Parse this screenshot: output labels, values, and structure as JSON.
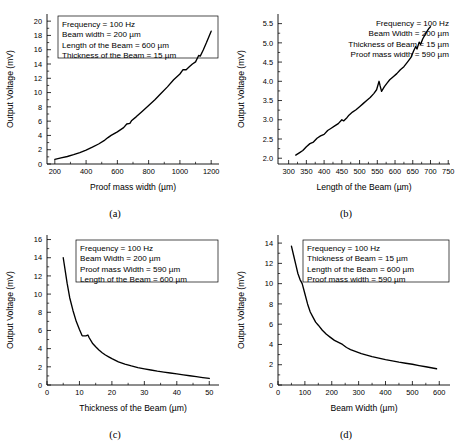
{
  "figure": {
    "title": "",
    "panel_labels": [
      "(a)",
      "(b)",
      "(c)",
      "(d)"
    ]
  },
  "chart_data": [
    {
      "id": "a",
      "type": "line",
      "title": "",
      "panel_label": "(a)",
      "xlabel": "Proof mass width (µm)",
      "ylabel": "Output Voltage (mV)",
      "xlim": [
        150,
        1250
      ],
      "ylim": [
        0,
        21
      ],
      "xticks": [
        200,
        400,
        600,
        800,
        1000,
        1200
      ],
      "yticks": [
        0,
        2,
        4,
        6,
        8,
        10,
        12,
        14,
        16,
        18,
        20
      ],
      "grid": false,
      "legend": null,
      "annotations": [
        "Frequency = 100 Hz",
        "Beam width = 200 µm",
        "Length of the Beam = 600 µm",
        "Thickness of the Beam = 15 µm"
      ],
      "annotation_boxed": true,
      "x": [
        200,
        240,
        280,
        320,
        360,
        400,
        440,
        480,
        520,
        540,
        560,
        600,
        640,
        660,
        680,
        690,
        720,
        760,
        800,
        840,
        880,
        920,
        960,
        1000,
        1020,
        1040,
        1060,
        1080,
        1100,
        1120,
        1130,
        1150,
        1170,
        1200
      ],
      "y": [
        0.65,
        0.85,
        1.05,
        1.3,
        1.6,
        1.95,
        2.35,
        2.8,
        3.35,
        3.7,
        4.0,
        4.5,
        5.1,
        5.6,
        5.7,
        6.05,
        6.6,
        7.4,
        8.2,
        9.0,
        9.9,
        10.8,
        11.8,
        12.6,
        13.2,
        13.2,
        13.6,
        14.0,
        14.3,
        15.2,
        15.1,
        16.0,
        17.0,
        18.6
      ]
    },
    {
      "id": "b",
      "type": "line",
      "title": "",
      "panel_label": "(b)",
      "xlabel": "Length of the Beam (µm)",
      "ylabel": "Output Voltage (mV)",
      "xlim": [
        270,
        755
      ],
      "ylim": [
        1.85,
        5.75
      ],
      "xticks": [
        300,
        350,
        400,
        450,
        500,
        550,
        600,
        650,
        700,
        750
      ],
      "yticks": [
        2.0,
        2.5,
        3.0,
        3.5,
        4.0,
        4.5,
        5.0,
        5.5
      ],
      "grid": false,
      "legend": null,
      "annotations": [
        "Frequency = 100 Hz",
        "Beam Width = 200 µm",
        "Thickness of Beam = 15 µm",
        "Proof mass width = 590 µm"
      ],
      "annotation_boxed": false,
      "x": [
        320,
        330,
        340,
        350,
        360,
        370,
        380,
        390,
        400,
        410,
        420,
        430,
        440,
        450,
        455,
        465,
        470,
        480,
        490,
        500,
        510,
        520,
        530,
        540,
        548,
        555,
        558,
        562,
        570,
        578,
        585,
        595,
        605,
        615,
        625,
        635,
        645,
        652,
        658,
        662,
        668,
        672,
        678,
        684,
        690,
        696,
        700
      ],
      "y": [
        2.08,
        2.14,
        2.2,
        2.3,
        2.38,
        2.42,
        2.52,
        2.58,
        2.62,
        2.72,
        2.78,
        2.84,
        2.9,
        3.0,
        2.97,
        3.06,
        3.12,
        3.2,
        3.26,
        3.34,
        3.42,
        3.5,
        3.58,
        3.68,
        3.78,
        4.0,
        3.88,
        3.74,
        3.86,
        3.96,
        4.04,
        4.12,
        4.2,
        4.3,
        4.38,
        4.5,
        4.62,
        4.78,
        4.9,
        4.84,
        5.02,
        4.96,
        5.1,
        5.2,
        5.3,
        5.38,
        5.42
      ]
    },
    {
      "id": "c",
      "type": "line",
      "title": "",
      "panel_label": "(c)",
      "xlabel": "Thickness of the Beam (µm)",
      "ylabel": "Output Voltage (mV)",
      "xlim": [
        0,
        53
      ],
      "ylim": [
        0,
        16.5
      ],
      "xticks": [
        0,
        10,
        20,
        30,
        40,
        50
      ],
      "yticks": [
        0,
        2,
        4,
        6,
        8,
        10,
        12,
        14,
        16
      ],
      "grid": false,
      "legend": null,
      "annotations": [
        "Frequency = 100 Hz",
        "Beam Width = 200 µm",
        "Proof mass Width = 590 µm",
        "Length of the Beam = 600 µm"
      ],
      "annotation_boxed": true,
      "x": [
        5,
        5.6,
        6.2,
        7,
        8,
        9,
        10,
        10.8,
        11,
        12,
        12.6,
        13,
        14,
        15,
        16,
        17,
        18,
        19,
        20,
        22,
        24,
        26,
        28,
        30,
        32,
        34,
        36,
        38,
        40,
        42,
        44,
        46,
        48,
        50
      ],
      "y": [
        14.0,
        12.6,
        11.2,
        9.6,
        8.2,
        7.0,
        6.1,
        5.45,
        5.4,
        5.4,
        5.5,
        5.2,
        4.6,
        4.2,
        3.85,
        3.55,
        3.3,
        3.1,
        2.9,
        2.55,
        2.3,
        2.1,
        1.92,
        1.78,
        1.65,
        1.52,
        1.42,
        1.32,
        1.22,
        1.12,
        1.02,
        0.92,
        0.82,
        0.72
      ]
    },
    {
      "id": "d",
      "type": "line",
      "title": "",
      "panel_label": "(d)",
      "xlabel": "Beam Width (µm)",
      "ylabel": "Output Voltage (mV)",
      "xlim": [
        0,
        640
      ],
      "ylim": [
        0,
        14.8
      ],
      "xticks": [
        0,
        100,
        200,
        300,
        400,
        500,
        600
      ],
      "yticks": [
        0,
        2,
        4,
        6,
        8,
        10,
        12,
        14
      ],
      "grid": false,
      "legend": null,
      "annotations": [
        "Frequency = 100 Hz",
        "Thickness of Beam = 15 µm",
        "Length of the Beam = 600 µm",
        "Proof mass width = 590 µm"
      ],
      "annotation_boxed": true,
      "x": [
        50,
        58,
        66,
        74,
        82,
        90,
        100,
        110,
        120,
        130,
        140,
        150,
        165,
        180,
        195,
        210,
        225,
        240,
        255,
        270,
        290,
        310,
        330,
        350,
        375,
        400,
        425,
        450,
        475,
        500,
        525,
        550,
        570,
        590
      ],
      "y": [
        13.7,
        12.8,
        11.9,
        11.0,
        10.4,
        10.0,
        9.0,
        8.0,
        7.2,
        6.7,
        6.2,
        5.9,
        5.4,
        5.0,
        4.7,
        4.4,
        4.2,
        4.0,
        3.7,
        3.5,
        3.3,
        3.1,
        2.95,
        2.8,
        2.65,
        2.5,
        2.38,
        2.25,
        2.15,
        2.05,
        1.92,
        1.8,
        1.7,
        1.6
      ]
    }
  ]
}
